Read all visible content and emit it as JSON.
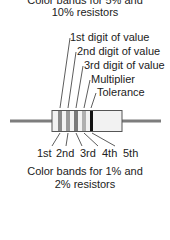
{
  "top_caption": {
    "line1": "Color bands for 5% and",
    "line2": "10% resistors"
  },
  "callouts": [
    {
      "label": "1st digit of value"
    },
    {
      "label": "2nd digit of value"
    },
    {
      "label": "3rd digit of value"
    },
    {
      "label": "Multiplier"
    },
    {
      "label": "Tolerance"
    }
  ],
  "bands": [
    {
      "name": "1st",
      "color": "#8a8a8a"
    },
    {
      "name": "2nd",
      "color": "#9a9a9a"
    },
    {
      "name": "3rd",
      "color": "#7a7a7a"
    },
    {
      "name": "4th",
      "color": "#b0b0b0"
    },
    {
      "name": "5th",
      "color": "#111111"
    }
  ],
  "band_labels": [
    "1st",
    "2nd",
    "3rd",
    "4th",
    "5th"
  ],
  "bottom_caption": {
    "line1": "Color bands for 1% and",
    "line2": "2% resistors"
  },
  "colors": {
    "lead": "#7d7d7d",
    "body_fill": "#f2f2f2",
    "body_stroke": "#555555",
    "leader_line": "#333333"
  }
}
